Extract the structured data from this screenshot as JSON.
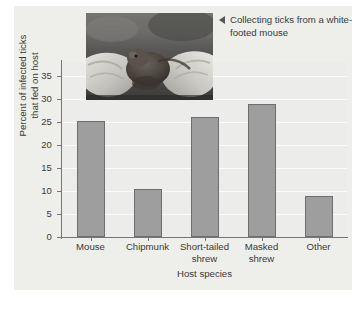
{
  "figure": {
    "caption": "Collecting ticks from a white-footed mouse",
    "caption_arrow_icon": "left-triangle-icon",
    "photo_alt": "Gloved hands holding a white-footed mouse"
  },
  "chart_data": {
    "type": "bar",
    "title": "",
    "categories": [
      "Mouse",
      "Chipmunk",
      "Short-tailed shrew",
      "Masked shrew",
      "Other"
    ],
    "values": [
      25.3,
      10.4,
      26.0,
      28.8,
      8.9
    ],
    "xlabel": "Host species",
    "ylabel": "Percent of infected ticks that fed on host",
    "ylabel_line1": "Percent of infected ticks",
    "ylabel_line2": "that fed on host",
    "ylim": [
      0,
      38
    ],
    "yticks": [
      0,
      5,
      10,
      15,
      20,
      25,
      30,
      35
    ],
    "ytick_labels": [
      "0",
      "5",
      "10",
      "15",
      "20",
      "25",
      "30",
      "35"
    ],
    "grid": true,
    "legend": false,
    "bar_color": "#9e9e9e",
    "bar_edge_color": "#6e6e6e",
    "panel_color": "#ececea",
    "axis_color": "#76767a"
  }
}
